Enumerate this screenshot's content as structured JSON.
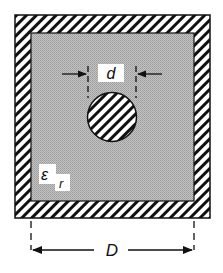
{
  "diagram": {
    "labels": {
      "inner_diameter": "d",
      "outer_width": "D",
      "permittivity_symbol": "ε",
      "permittivity_subscript": "r"
    },
    "colors": {
      "background": "#ffffff",
      "dielectric_fill": "#b9b9b9",
      "conductor_hatch": "#111111",
      "label_background": "#ffffff"
    }
  }
}
